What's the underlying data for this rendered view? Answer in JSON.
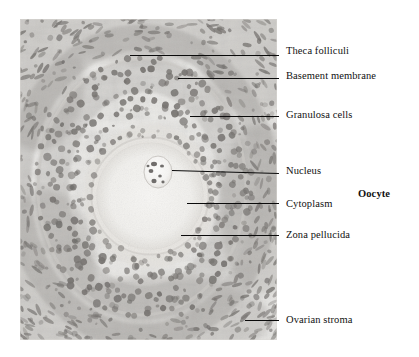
{
  "figure": {
    "type": "histology-micrograph-labeled-diagram",
    "micrograph": {
      "alt": "Light micrograph of a secondary ovarian follicle stained with haematoxylin and eosin",
      "frame": {
        "x": 20,
        "y": 19,
        "width": 257,
        "height": 321
      }
    },
    "group_labels": [
      {
        "id": "oocyte",
        "text": "Oocyte",
        "bold": true,
        "x": 358,
        "y": 188
      }
    ],
    "annotations": [
      {
        "id": "theca-folliculi",
        "text": "Theca folliculi",
        "label_x": 286,
        "label_y": 45,
        "leader": {
          "x1": 130,
          "y1": 55,
          "x2": 279,
          "y2": 55
        }
      },
      {
        "id": "basement-membrane",
        "text": "Basement membrane",
        "label_x": 286,
        "label_y": 70,
        "leader": {
          "x1": 178,
          "y1": 78,
          "x2": 279,
          "y2": 78
        }
      },
      {
        "id": "granulosa-cells",
        "text": "Granulosa cells",
        "label_x": 286,
        "label_y": 109,
        "leader": {
          "x1": 190,
          "y1": 116,
          "x2": 279,
          "y2": 116
        }
      },
      {
        "id": "nucleus",
        "text": "Nucleus",
        "label_x": 286,
        "label_y": 165,
        "leader": {
          "x1": 172,
          "y1": 170,
          "x2": 279,
          "y2": 173
        }
      },
      {
        "id": "cytoplasm",
        "text": "Cytoplasm",
        "label_x": 286,
        "label_y": 198,
        "leader": {
          "x1": 187,
          "y1": 203,
          "x2": 279,
          "y2": 203
        }
      },
      {
        "id": "zona-pellucida",
        "text": "Zona pellucida",
        "label_x": 286,
        "label_y": 229,
        "leader": {
          "x1": 181,
          "y1": 235,
          "x2": 279,
          "y2": 235
        }
      },
      {
        "id": "ovarian-stroma",
        "text": "Ovarian stroma",
        "label_x": 286,
        "label_y": 314,
        "leader": {
          "x1": 245,
          "y1": 320,
          "x2": 279,
          "y2": 320
        }
      }
    ],
    "colors": {
      "line": "#0a0a0a",
      "text": "#111111",
      "background": "#ffffff",
      "tissue_light": "#f1f0ee",
      "tissue_mid": "#c9c7c4",
      "nuclei_dark": "#6f6c6a",
      "oocyte_pale": "#f4f3f1"
    },
    "structures": {
      "oocyte_center": {
        "x": 150,
        "y": 196
      },
      "oocyte_radius": 56,
      "nucleus_center": {
        "x": 158,
        "y": 172
      },
      "nucleus_radius": 13
    }
  }
}
